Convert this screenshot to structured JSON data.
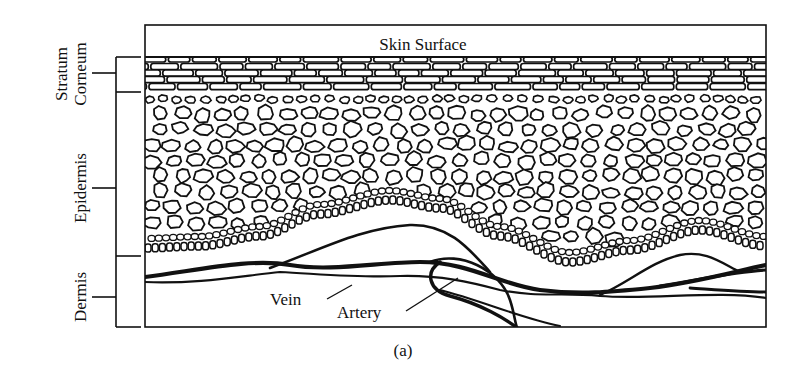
{
  "figure": {
    "caption": "(a)",
    "surface_label": "Skin Surface",
    "callouts": {
      "vein": "Vein",
      "artery": "Artery"
    },
    "layers": [
      {
        "id": "stratum-corneum",
        "label_line1": "Stratum",
        "label_line2": "Corneum"
      },
      {
        "id": "epidermis",
        "label": "Epidermis"
      },
      {
        "id": "dermis",
        "label": "Dermis"
      }
    ],
    "colors": {
      "ink": "#111111",
      "paper": "#ffffff"
    }
  }
}
